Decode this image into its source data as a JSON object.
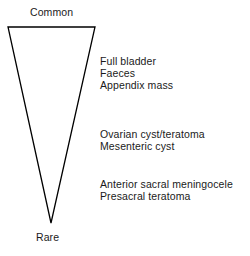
{
  "figure": {
    "background_color": "#ffffff",
    "stroke_color": "#000000",
    "text_color": "#1a1a1a"
  },
  "triangle": {
    "name": "inverted-triangle",
    "top_label": "Common",
    "bottom_label": "Rare",
    "top_left_point": "8,27",
    "top_right_point": "95,27",
    "apex_point": "51,223",
    "points": "8,27 95,27 51,223",
    "stroke_width": 1.3
  },
  "groups": [
    {
      "name": "common-group",
      "entries": [
        "Full bladder",
        "Faeces",
        "Appendix mass"
      ]
    },
    {
      "name": "intermediate-group",
      "entries": [
        "Ovarian cyst/teratoma",
        "Mesenteric cyst"
      ]
    },
    {
      "name": "rare-group",
      "entries": [
        "Anterior sacral meningocele",
        "Presacral teratoma"
      ]
    }
  ]
}
